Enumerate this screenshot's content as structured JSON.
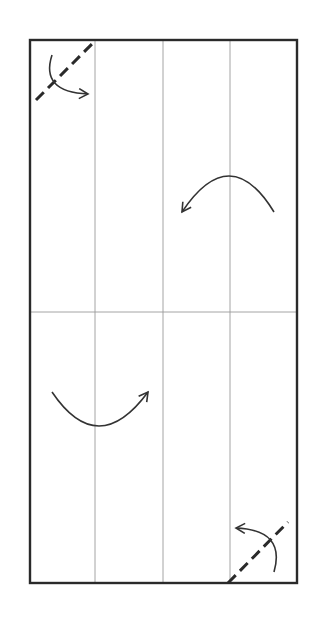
{
  "diagram": {
    "type": "origami-fold-diagram",
    "colors": {
      "paper": "#ffffff",
      "outline": "#2a2a2a",
      "crease": "#9a9a9a",
      "arrow": "#333333"
    },
    "paper_rect": {
      "x": 30,
      "y": 40,
      "width": 267,
      "height": 543
    },
    "creases": {
      "vertical_x": [
        95,
        163,
        230
      ],
      "horizontal_y": [
        312
      ]
    },
    "valley_folds": [
      {
        "name": "top-left-corner-fold",
        "x1": 36,
        "y1": 100,
        "x2": 95,
        "y2": 41
      },
      {
        "name": "bottom-right-corner-fold",
        "x1": 228,
        "y1": 583,
        "x2": 288,
        "y2": 522
      }
    ],
    "arrows": [
      {
        "name": "top-left-corner-arrow",
        "path": "M 52 55 Q 40 92 88 94",
        "head": "end"
      },
      {
        "name": "upper-flap-arrow",
        "path": "M 274 212 Q 230 140 182 212",
        "head": "end"
      },
      {
        "name": "lower-flap-arrow",
        "path": "M 52 392 Q 98 460 148 392",
        "head": "end"
      },
      {
        "name": "bottom-right-corner-arrow",
        "path": "M 274 572 Q 286 530 236 528",
        "head": "end"
      }
    ]
  }
}
